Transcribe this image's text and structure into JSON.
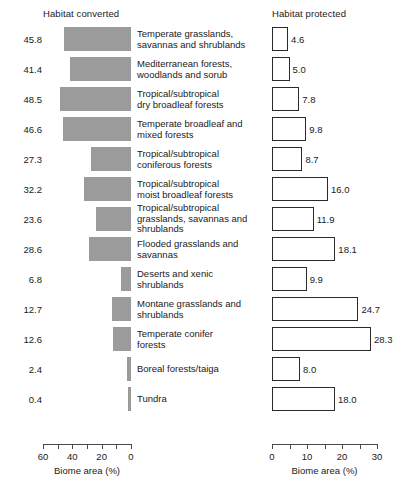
{
  "headers": {
    "left": "Habitat converted",
    "right": "Habitat protected"
  },
  "chart_data": {
    "type": "bar",
    "title": "",
    "orientation": "horizontal",
    "panels": [
      {
        "name": "habitat-converted",
        "title": "Habitat converted",
        "xlabel": "Biome area (%)",
        "direction": "right-to-left",
        "xlim": [
          0,
          60
        ],
        "ticks": [
          60,
          50,
          40,
          30,
          20,
          10,
          0
        ],
        "tick_labels": [
          "60",
          "",
          "40",
          "",
          "20",
          "",
          "0"
        ],
        "bar_style": "filled-gray",
        "bar_color": "#9b9b9b",
        "values": [
          45.8,
          41.4,
          48.5,
          46.6,
          27.3,
          32.2,
          23.6,
          28.6,
          6.8,
          12.7,
          12.6,
          2.4,
          0.4
        ]
      },
      {
        "name": "habitat-protected",
        "title": "Habitat protected",
        "xlabel": "Biome area (%)",
        "direction": "left-to-right",
        "xlim": [
          0,
          30
        ],
        "ticks": [
          0,
          5,
          10,
          15,
          20,
          25,
          30
        ],
        "tick_labels": [
          "0",
          "",
          "10",
          "",
          "20",
          "",
          "30"
        ],
        "bar_style": "outlined-white",
        "bar_color": "#ffffff",
        "bar_edge_color": "#2b2b2b",
        "values": [
          4.6,
          5.0,
          7.8,
          9.8,
          8.7,
          16.0,
          11.9,
          18.1,
          9.9,
          24.7,
          28.3,
          8.0,
          18.0
        ]
      }
    ],
    "categories": [
      "Temperate grasslands, savannas and shrublands",
      "Mediterranean forests, woodlands and sorub",
      "Tropical/subtropical dry broadleaf forests",
      "Temperate broadleaf and mixed forests",
      "Tropical/subtropical coniferous forests",
      "Tropical/subtropical moist broadleaf forests",
      "Tropical/subtropical grasslands, savannas and shrublands",
      "Flooded grasslands and savannas",
      "Deserts and xenic shrublands",
      "Montane grasslands and shrublands",
      "Temperate conifer forests",
      "Boreal forests/taiga",
      "Tundra"
    ],
    "grid": false,
    "legend": "none"
  },
  "rows": [
    {
      "label_lines": [
        "Temperate grasslands,",
        "savannas and shrublands"
      ],
      "converted": "45.8",
      "protected": "4.6",
      "converted_value": 45.8,
      "protected_value": 4.6
    },
    {
      "label_lines": [
        "Mediterranean forests,",
        "woodlands and sorub"
      ],
      "converted": "41.4",
      "protected": "5.0",
      "converted_value": 41.4,
      "protected_value": 5.0
    },
    {
      "label_lines": [
        "Tropical/subtropical",
        "dry broadleaf forests"
      ],
      "converted": "48.5",
      "protected": "7.8",
      "converted_value": 48.5,
      "protected_value": 7.8
    },
    {
      "label_lines": [
        "Temperate broadleaf and",
        "mixed forests"
      ],
      "converted": "46.6",
      "protected": "9.8",
      "converted_value": 46.6,
      "protected_value": 9.8
    },
    {
      "label_lines": [
        "Tropical/subtropical",
        "coniferous forests"
      ],
      "converted": "27.3",
      "protected": "8.7",
      "converted_value": 27.3,
      "protected_value": 8.7
    },
    {
      "label_lines": [
        "Tropical/subtropical",
        "moist broadleaf forests"
      ],
      "converted": "32.2",
      "protected": "16.0",
      "converted_value": 32.2,
      "protected_value": 16.0
    },
    {
      "label_lines": [
        "Tropical/subtropical",
        "grasslands, savannas and",
        "shrublands"
      ],
      "converted": "23.6",
      "protected": "11.9",
      "converted_value": 23.6,
      "protected_value": 11.9
    },
    {
      "label_lines": [
        "Flooded grasslands and",
        "savannas"
      ],
      "converted": "28.6",
      "protected": "18.1",
      "converted_value": 28.6,
      "protected_value": 18.1
    },
    {
      "label_lines": [
        "Deserts and xenic",
        "shrublands"
      ],
      "converted": "6.8",
      "protected": "9.9",
      "converted_value": 6.8,
      "protected_value": 9.9
    },
    {
      "label_lines": [
        "Montane grasslands and",
        "shrublands"
      ],
      "converted": "12.7",
      "protected": "24.7",
      "converted_value": 12.7,
      "protected_value": 24.7
    },
    {
      "label_lines": [
        "Temperate conifer",
        "forests"
      ],
      "converted": "12.6",
      "protected": "28.3",
      "converted_value": 12.6,
      "protected_value": 28.3
    },
    {
      "label_lines": [
        "Boreal forests/taiga"
      ],
      "converted": "2.4",
      "protected": "8.0",
      "converted_value": 2.4,
      "protected_value": 8.0
    },
    {
      "label_lines": [
        "Tundra"
      ],
      "converted": "0.4",
      "protected": "18.0",
      "converted_value": 0.4,
      "protected_value": 18.0
    }
  ],
  "axes": {
    "left": {
      "title": "Biome area (%)",
      "tick_labels": [
        "60",
        "",
        "40",
        "",
        "20",
        "",
        "0"
      ],
      "tick_values": [
        60,
        50,
        40,
        30,
        20,
        10,
        0
      ],
      "max": 60
    },
    "right": {
      "title": "Biome area (%)",
      "tick_labels": [
        "0",
        "",
        "10",
        "",
        "20",
        "",
        "30"
      ],
      "tick_values": [
        0,
        5,
        10,
        15,
        20,
        25,
        30
      ],
      "max": 30
    }
  }
}
